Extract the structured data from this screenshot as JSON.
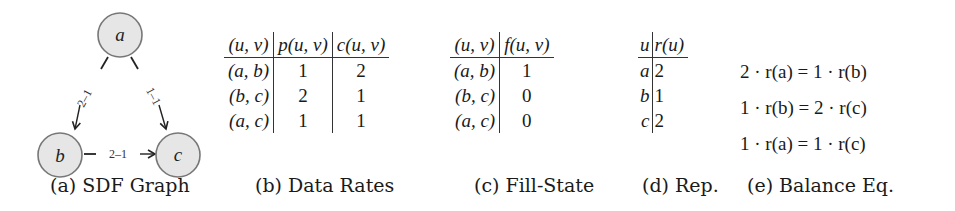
{
  "graph": {
    "nodes": [
      {
        "id": "a",
        "label": "a",
        "cx": 120,
        "cy": 35
      },
      {
        "id": "b",
        "label": "b",
        "cx": 62,
        "cy": 155
      },
      {
        "id": "c",
        "label": "c",
        "cx": 178,
        "cy": 155
      }
    ],
    "edges": [
      {
        "from": "a",
        "to": "b",
        "label": "2–1"
      },
      {
        "from": "a",
        "to": "c",
        "label": "1–1"
      },
      {
        "from": "b",
        "to": "c",
        "label": "2–1"
      }
    ],
    "node_fill": "#e6e6e6",
    "node_stroke": "#777777",
    "caption": "(a) SDF Graph"
  },
  "data_rates": {
    "headers": [
      "(u, v)",
      "p(u, v)",
      "c(u, v)"
    ],
    "rows": [
      [
        "(a, b)",
        "1",
        "2"
      ],
      [
        "(b, c)",
        "2",
        "1"
      ],
      [
        "(a, c)",
        "1",
        "1"
      ]
    ],
    "caption": "(b) Data Rates"
  },
  "fill_state": {
    "headers": [
      "(u, v)",
      "f(u, v)"
    ],
    "rows": [
      [
        "(a, b)",
        "1"
      ],
      [
        "(b, c)",
        "0"
      ],
      [
        "(a, c)",
        "0"
      ]
    ],
    "caption": "(c) Fill-State"
  },
  "repetition": {
    "headers": [
      "u",
      "r(u)"
    ],
    "rows": [
      [
        "a",
        "2"
      ],
      [
        "b",
        "1"
      ],
      [
        "c",
        "2"
      ]
    ],
    "caption": "(d) Rep."
  },
  "balance": {
    "equations": [
      "2 · r(a) = 1 · r(b)",
      "1 · r(b) = 2 · r(c)",
      "1 · r(a) = 1 · r(c)"
    ],
    "caption": "(e) Balance Eq."
  }
}
